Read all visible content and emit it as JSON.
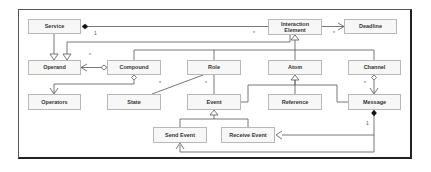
{
  "diagram": {
    "type": "UML class diagram",
    "classes": {
      "service": "Service",
      "operand": "Operand",
      "compound": "Compound",
      "operators": "Operators",
      "state": "State",
      "role": "Role",
      "event": "Event",
      "interaction_element": "Interaction\nElement",
      "deadline": "Deadline",
      "atom": "Atom",
      "reference": "Reference",
      "channel": "Channel",
      "message": "Message",
      "send_event": "Send Event",
      "receive_event": "Receive Event"
    },
    "multiplicities": {
      "service_ie_one": "1",
      "service_ie_many": "*",
      "operand_many": "*",
      "deadline_many": "*",
      "compound_state": "*",
      "role_event": "*",
      "channel_message": "*",
      "message_events": "1"
    },
    "relations": [
      {
        "from": "Service",
        "to": "Operand",
        "kind": "generalization"
      },
      {
        "from": "Interaction Element",
        "to": "Operand",
        "kind": "generalization"
      },
      {
        "from": "Service",
        "to": "Interaction Element",
        "kind": "composition"
      },
      {
        "from": "Interaction Element",
        "to": "Deadline",
        "kind": "association"
      },
      {
        "from": "Compound",
        "to": "Operand",
        "kind": "aggregation"
      },
      {
        "from": "Compound",
        "to": "Operators",
        "kind": "aggregation"
      },
      {
        "from": "Role",
        "to": "State",
        "kind": "association"
      },
      {
        "from": "Role",
        "to": "Event",
        "kind": "association"
      },
      {
        "from": "Compound",
        "to": "Interaction Element",
        "kind": "generalization"
      },
      {
        "from": "Role",
        "to": "Interaction Element",
        "kind": "generalization"
      },
      {
        "from": "Atom",
        "to": "Interaction Element",
        "kind": "generalization"
      },
      {
        "from": "Channel",
        "to": "Interaction Element",
        "kind": "generalization"
      },
      {
        "from": "Event",
        "to": "Atom",
        "kind": "generalization"
      },
      {
        "from": "Reference",
        "to": "Atom",
        "kind": "generalization"
      },
      {
        "from": "Message",
        "to": "Atom",
        "kind": "generalization"
      },
      {
        "from": "Channel",
        "to": "Message",
        "kind": "aggregation"
      },
      {
        "from": "Send Event",
        "to": "Event",
        "kind": "generalization"
      },
      {
        "from": "Receive Event",
        "to": "Event",
        "kind": "generalization"
      },
      {
        "from": "Message",
        "to": "Receive Event",
        "kind": "composition"
      },
      {
        "from": "Message",
        "to": "Send Event",
        "kind": "composition"
      }
    ]
  }
}
